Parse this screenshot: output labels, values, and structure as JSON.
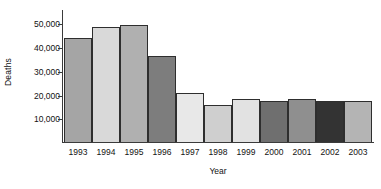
{
  "chart_data": {
    "type": "bar",
    "title": "",
    "xlabel": "Year",
    "ylabel": "Deaths",
    "categories": [
      "1993",
      "1994",
      "1995",
      "1996",
      "1997",
      "1998",
      "1999",
      "2000",
      "2001",
      "2002",
      "2003"
    ],
    "values": [
      44300,
      49000,
      49800,
      36500,
      21000,
      15500,
      18100,
      17200,
      18200,
      17200,
      17500
    ],
    "bar_colors": [
      "#a5a5a5",
      "#d9d9d9",
      "#b0b0b0",
      "#7d7d7d",
      "#e8e8e8",
      "#cfcfcf",
      "#e2e2e2",
      "#6f6f6f",
      "#8f8f8f",
      "#333333",
      "#b4b4b4"
    ],
    "ylim": [
      0,
      56000
    ],
    "yticks": [
      10000,
      20000,
      30000,
      40000,
      50000
    ],
    "ytick_labels": [
      "10,000",
      "20,000",
      "30,000",
      "40,000",
      "50,000"
    ],
    "grid": false,
    "legend": "none",
    "axis_color": "#3b3b3b",
    "bar_edge_color": "#2e2e2e"
  }
}
